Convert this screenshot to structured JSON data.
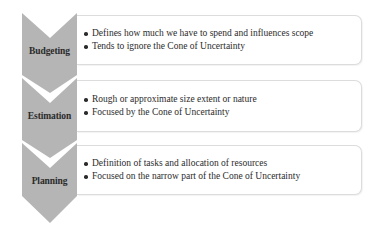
{
  "diagram": {
    "colors": {
      "chevron_fill": "#b5b5b5",
      "box_border": "#dcdcdc",
      "text": "#2b2b2b"
    },
    "stages": [
      {
        "label": "Budgeting",
        "bullets": [
          "Defines how much we have to spend and influences scope",
          "Tends to ignore the Cone of Uncertainty"
        ]
      },
      {
        "label": "Estimation",
        "bullets": [
          "Rough or approximate size extent or nature",
          "Focused by the Cone of Uncertainty"
        ]
      },
      {
        "label": "Planning",
        "bullets": [
          "Definition of tasks and allocation of resources",
          "Focused on the narrow part of the Cone of Uncertainty"
        ]
      }
    ]
  }
}
